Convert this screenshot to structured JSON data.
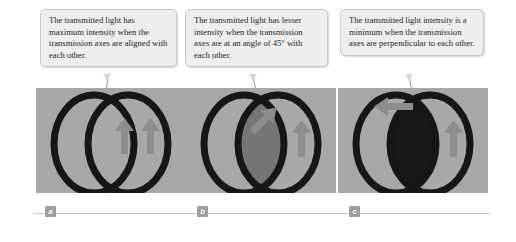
{
  "credit": "Henry Leap and Jim Lehman",
  "callouts": [
    {
      "id": "a",
      "text": "The transmitted light has maximum intensity when the transmission axes are aligned with each other."
    },
    {
      "id": "b",
      "text": "The transmitted light has lesser intensity when the transmission axes are at an angle of 45° with each other."
    },
    {
      "id": "c",
      "text": "The transmitted light intensity is a minimum when the transmission axes are perpendicular to each other."
    }
  ],
  "panels": [
    {
      "label": "a",
      "overlap_shade": "#a8a8a8",
      "description": "Two polarizer discs overlapping; overlap region is light gray (maximum transmission); two arrows both point vertically upward, parallel."
    },
    {
      "label": "b",
      "overlap_shade": "#757575",
      "description": "Two polarizer discs overlapping; overlap region is medium gray (reduced transmission); one arrow points up at 45 degrees, the other points vertically upward."
    },
    {
      "label": "c",
      "overlap_shade": "#1a1714",
      "description": "Two polarizer discs overlapping; overlap region is black (minimum transmission); one arrow points horizontally left, the other points vertically upward."
    }
  ],
  "colors": {
    "photo_background": "#a8a8a8",
    "ring": "#191514",
    "arrow": "#8d8d8d",
    "callout_fill": "#eeeeee",
    "callout_border": "#c9c9c9",
    "label_box": "#9c9c9c",
    "rule": "#c6c6c6"
  }
}
